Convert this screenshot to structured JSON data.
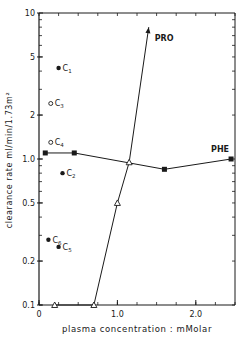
{
  "chart_data": {
    "type": "line",
    "title": "",
    "xlabel": "plasma concentration : mMolar",
    "ylabel": "clearance rate  ml/min/1.73m²",
    "xlim": [
      0,
      2.5
    ],
    "ylim": [
      0.1,
      10
    ],
    "yscale": "log",
    "grid": false,
    "x_ticks": [
      {
        "value": 0,
        "label": "0"
      },
      {
        "value": 1.0,
        "label": "1.0"
      },
      {
        "value": 2.0,
        "label": "2.0"
      }
    ],
    "y_ticks": [
      {
        "value": 10,
        "label": "10"
      },
      {
        "value": 5,
        "label": "5"
      },
      {
        "value": 2,
        "label": "2"
      },
      {
        "value": 1.0,
        "label": "1.0"
      },
      {
        "value": 0.5,
        "label": "0.5"
      },
      {
        "value": 0.2,
        "label": "0.2"
      },
      {
        "value": 0.1,
        "label": "0.1"
      }
    ],
    "series": [
      {
        "name": "PHE",
        "marker": "filled-square",
        "x": [
          0.08,
          0.45,
          1.6,
          2.45
        ],
        "y": [
          1.1,
          1.1,
          0.85,
          1.0
        ]
      },
      {
        "name": "PRO",
        "marker": "open-triangle",
        "x": [
          0.2,
          0.7,
          1.0,
          1.15
        ],
        "y": [
          0.1,
          0.1,
          0.5,
          0.95
        ],
        "arrow_to": {
          "x": 1.4,
          "y": 8.0
        }
      }
    ],
    "annotations": [
      {
        "label": "C",
        "sub": "1",
        "marker": "filled-circle",
        "x": 0.25,
        "y": 4.2
      },
      {
        "label": "C",
        "sub": "3",
        "marker": "open-circle",
        "x": 0.15,
        "y": 2.4
      },
      {
        "label": "C",
        "sub": "4",
        "marker": "open-circle",
        "x": 0.15,
        "y": 1.3
      },
      {
        "label": "C",
        "sub": "2",
        "marker": "filled-circle",
        "x": 0.3,
        "y": 0.8
      },
      {
        "label": "C",
        "sub": "6",
        "marker": "filled-circle",
        "x": 0.12,
        "y": 0.28
      },
      {
        "label": "C",
        "sub": "5",
        "marker": "filled-circle",
        "x": 0.25,
        "y": 0.25
      }
    ]
  }
}
